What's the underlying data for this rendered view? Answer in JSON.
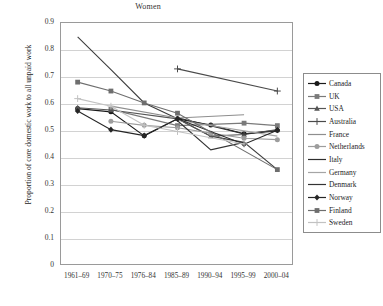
{
  "chart_data": {
    "type": "line",
    "title": "Women",
    "xlabel": "",
    "ylabel": "Proportion of core domestic work to all unpaid work",
    "categories": [
      "1961–69",
      "1970–75",
      "1976–84",
      "1985–89",
      "1990–94",
      "1995–99",
      "2000–04"
    ],
    "ylim": [
      0,
      0.9
    ],
    "yticks": [
      "0",
      "0.1",
      "0.2",
      "0.3",
      "0.4",
      "0.5",
      "0.6",
      "0.7",
      "0.8",
      "0.9"
    ],
    "grid": true,
    "legend_position": "right-outside",
    "series": [
      {
        "name": "Canada",
        "color": "#1a1a1a",
        "marker": "circle",
        "values": [
          0.583,
          0.571,
          0.482,
          0.545,
          0.522,
          0.49,
          0.503
        ]
      },
      {
        "name": "UK",
        "color": "#7a7a7a",
        "marker": "square",
        "values": [
          null,
          0.58,
          null,
          0.52,
          null,
          0.529,
          0.52
        ]
      },
      {
        "name": "USA",
        "color": "#555555",
        "marker": "triangle",
        "values": [
          0.586,
          0.578,
          null,
          0.545,
          0.481,
          0.487,
          0.505
        ]
      },
      {
        "name": "Australia",
        "color": "#4a4a4a",
        "marker": "plus",
        "values": [
          null,
          null,
          null,
          0.73,
          null,
          null,
          0.648
        ]
      },
      {
        "name": "France",
        "color": "#8e8e8e",
        "marker": "none",
        "values": [
          null,
          0.592,
          null,
          0.548,
          null,
          0.56,
          null
        ]
      },
      {
        "name": "Netherlands",
        "color": "#9d9d9d",
        "marker": "circle",
        "values": [
          null,
          0.536,
          0.521,
          0.512,
          0.492,
          0.473,
          0.468
        ]
      },
      {
        "name": "Italy",
        "color": "#2e2e2e",
        "marker": "none",
        "values": [
          null,
          null,
          null,
          0.549,
          null,
          0.489,
          0.5
        ]
      },
      {
        "name": "Germany",
        "color": "#a5a5a5",
        "marker": "none",
        "values": [
          null,
          null,
          null,
          0.54,
          null,
          null,
          0.481
        ]
      },
      {
        "name": "Denmark",
        "color": "#333333",
        "marker": "none",
        "values": [
          null,
          null,
          null,
          0.538,
          0.43,
          0.458,
          null
        ]
      },
      {
        "name": "Norway",
        "color": "#262626",
        "marker": "diamond",
        "values": [
          0.574,
          0.505,
          0.483,
          0.545,
          null,
          0.451,
          0.503
        ]
      },
      {
        "name": "Finland",
        "color": "#6e6e6e",
        "marker": "square",
        "values": [
          0.681,
          0.648,
          0.604,
          0.566,
          null,
          null,
          0.357
        ]
      },
      {
        "name": "Sweden",
        "color": "#c2c2c2",
        "marker": "plus",
        "values": [
          0.62,
          0.592,
          0.521,
          0.498,
          null,
          0.452,
          null
        ]
      }
    ],
    "extra_series": [
      {
        "name": "steep-line-a",
        "color": "#3d3d3d",
        "values": [
          0.849,
          0.727,
          0.604,
          0.545,
          0.481,
          0.458,
          0.357
        ]
      }
    ]
  }
}
